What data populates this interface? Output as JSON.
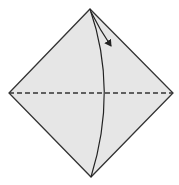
{
  "diagram": {
    "type": "origami-fold-step",
    "shape": "square-diamond",
    "colors": {
      "paper_fill": "#e6e6e6",
      "stroke": "#333333",
      "background": "#ffffff"
    },
    "vertices": {
      "top": [
        90,
        9
      ],
      "left": [
        9,
        93
      ],
      "right": [
        173,
        93
      ],
      "bottom": [
        91,
        177
      ]
    },
    "fold_line": {
      "style": "dashed",
      "from": [
        9,
        93
      ],
      "to": [
        173,
        93
      ],
      "meaning": "valley-fold"
    },
    "curved_crease": {
      "from": [
        90,
        9
      ],
      "to": [
        91,
        177
      ]
    },
    "arrow": {
      "from": [
        92,
        12
      ],
      "to": [
        112,
        47
      ]
    }
  }
}
